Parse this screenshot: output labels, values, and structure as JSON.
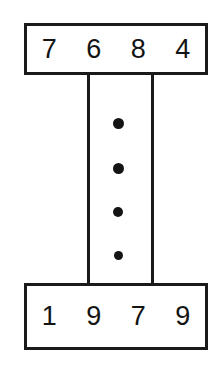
{
  "diagram": {
    "type": "number-range-diagram",
    "colors": {
      "stroke": "#1a1a1a",
      "text": "#141414",
      "background": "#ffffff",
      "dot": "#141414"
    },
    "top_box": {
      "label": "7684",
      "digits": [
        "7",
        "6",
        "8",
        "4"
      ]
    },
    "bottom_box": {
      "label": "1979",
      "digits": [
        "1",
        "9",
        "7",
        "9"
      ]
    },
    "ellipsis": {
      "symbol": "•",
      "count": 4,
      "meaning": "vertical-ellipsis"
    }
  }
}
